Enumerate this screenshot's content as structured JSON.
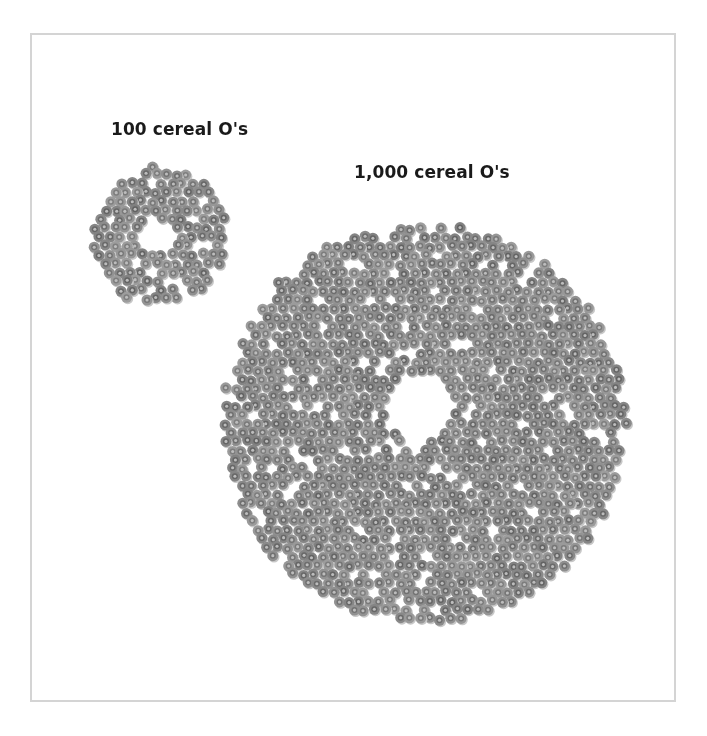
{
  "figure": {
    "frame": {
      "border_color": "#d4d4d4",
      "background": "#ffffff"
    },
    "groups": [
      {
        "label": "100 cereal O's",
        "count": 100,
        "center": [
          160,
          236
        ],
        "outer_radius": 70,
        "hole_center": [
          156,
          238
        ],
        "hole_radius": 18
      },
      {
        "label": "1,000 cereal O's",
        "count": 1000,
        "center": [
          424,
          423
        ],
        "outer_radius": 203,
        "hole_center": [
          420,
          410
        ],
        "hole_radius": 34
      }
    ],
    "cereal_style": {
      "diameter": 11,
      "ring_color": "#8c8c8c",
      "inner_ring_color": "#6e6e6e",
      "center_color": "#bdbdbd",
      "shadow_color": "#c8c8c8"
    }
  }
}
